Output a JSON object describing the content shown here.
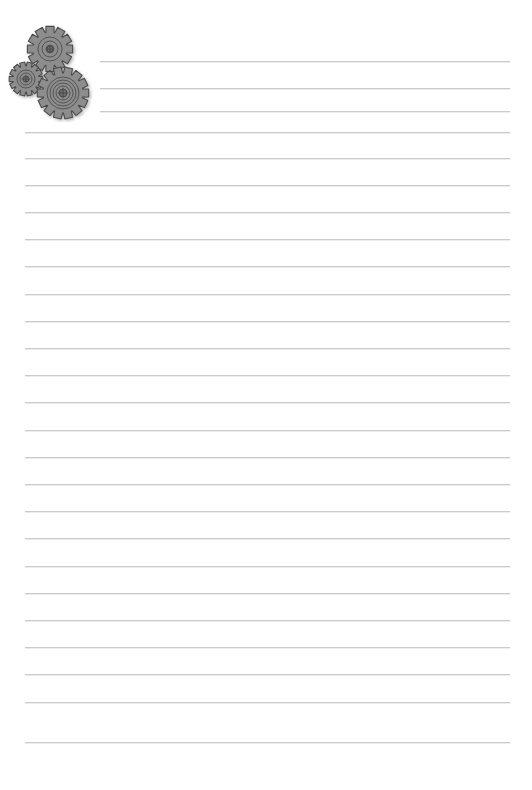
{
  "document": {
    "kind": "lined-notepaper",
    "title": "Lined Note Paper with Gears",
    "background_color": "#ffffff",
    "width": 532,
    "height": 790
  },
  "ruled_lines": {
    "color": "#c9c9cf",
    "thickness_px": 1,
    "spacing_px": 27.3,
    "first_line_y": 61,
    "last_line_y": 742,
    "count": 26,
    "default_left_x": 25,
    "indented_left_x": 100,
    "right_x": 510,
    "indented_line_numbers": [
      1,
      2,
      3
    ],
    "lines": [
      {
        "n": 1,
        "y": 61,
        "x1": 100,
        "x2": 510
      },
      {
        "n": 2,
        "y": 88,
        "x1": 100,
        "x2": 510
      },
      {
        "n": 3,
        "y": 111,
        "x1": 100,
        "x2": 510
      },
      {
        "n": 4,
        "y": 132,
        "x1": 25,
        "x2": 510
      },
      {
        "n": 5,
        "y": 158,
        "x1": 25,
        "x2": 510
      },
      {
        "n": 6,
        "y": 185,
        "x1": 25,
        "x2": 510
      },
      {
        "n": 7,
        "y": 212,
        "x1": 25,
        "x2": 510
      },
      {
        "n": 8,
        "y": 239,
        "x1": 25,
        "x2": 510
      },
      {
        "n": 9,
        "y": 266,
        "x1": 25,
        "x2": 510
      },
      {
        "n": 10,
        "y": 294,
        "x1": 25,
        "x2": 510
      },
      {
        "n": 11,
        "y": 321,
        "x1": 25,
        "x2": 510
      },
      {
        "n": 12,
        "y": 348,
        "x1": 25,
        "x2": 510
      },
      {
        "n": 13,
        "y": 375,
        "x1": 25,
        "x2": 510
      },
      {
        "n": 14,
        "y": 402,
        "x1": 25,
        "x2": 510
      },
      {
        "n": 15,
        "y": 430,
        "x1": 25,
        "x2": 510
      },
      {
        "n": 16,
        "y": 457,
        "x1": 25,
        "x2": 510
      },
      {
        "n": 17,
        "y": 484,
        "x1": 25,
        "x2": 510
      },
      {
        "n": 18,
        "y": 511,
        "x1": 25,
        "x2": 510
      },
      {
        "n": 19,
        "y": 538,
        "x1": 25,
        "x2": 510
      },
      {
        "n": 20,
        "y": 566,
        "x1": 25,
        "x2": 510
      },
      {
        "n": 21,
        "y": 593,
        "x1": 25,
        "x2": 510
      },
      {
        "n": 22,
        "y": 620,
        "x1": 25,
        "x2": 510
      },
      {
        "n": 23,
        "y": 647,
        "x1": 25,
        "x2": 510
      },
      {
        "n": 24,
        "y": 674,
        "x1": 25,
        "x2": 510
      },
      {
        "n": 25,
        "y": 702,
        "x1": 25,
        "x2": 510
      },
      {
        "n": 26,
        "y": 742,
        "x1": 25,
        "x2": 510
      }
    ]
  },
  "gear_cluster": {
    "label": "Gears illustration",
    "fill_color": "#8d8d8d",
    "stroke_color": "#4a4a4a",
    "hub_color": "#6e6e6e",
    "shadow_color": "#b9b9b9",
    "gears": [
      {
        "name": "gear-large-top",
        "cx": 48,
        "cy": 27,
        "outer_radius": 23,
        "root_radius": 17,
        "teeth": 12,
        "rings": [
          12,
          8,
          4
        ],
        "hub_radius": 3
      },
      {
        "name": "gear-small-left",
        "cx": 24,
        "cy": 57,
        "outer_radius": 17,
        "root_radius": 13,
        "teeth": 14,
        "rings": [
          9,
          6
        ],
        "hub_radius": 3
      },
      {
        "name": "gear-medium-bottom",
        "cx": 61,
        "cy": 71,
        "outer_radius": 26,
        "root_radius": 20,
        "teeth": 14,
        "rings": [
          16,
          13,
          10,
          7
        ],
        "hub_radius": 4
      }
    ]
  },
  "content": {
    "text_lines": [],
    "note": ""
  }
}
